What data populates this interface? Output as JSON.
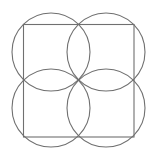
{
  "diagram": {
    "stroke_color": "#707070",
    "background": "#ffffff",
    "square": {
      "x": 23.5,
      "y": 24.5,
      "width": 110.5,
      "height": 112.5
    },
    "circles": [
      {
        "name": "top-left",
        "cx": 51,
        "cy": 52,
        "r": 39
      },
      {
        "name": "top-right",
        "cx": 106,
        "cy": 52,
        "r": 39
      },
      {
        "name": "bottom-left",
        "cx": 51,
        "cy": 108,
        "r": 39
      },
      {
        "name": "bottom-right",
        "cx": 106,
        "cy": 108,
        "r": 39
      }
    ]
  }
}
